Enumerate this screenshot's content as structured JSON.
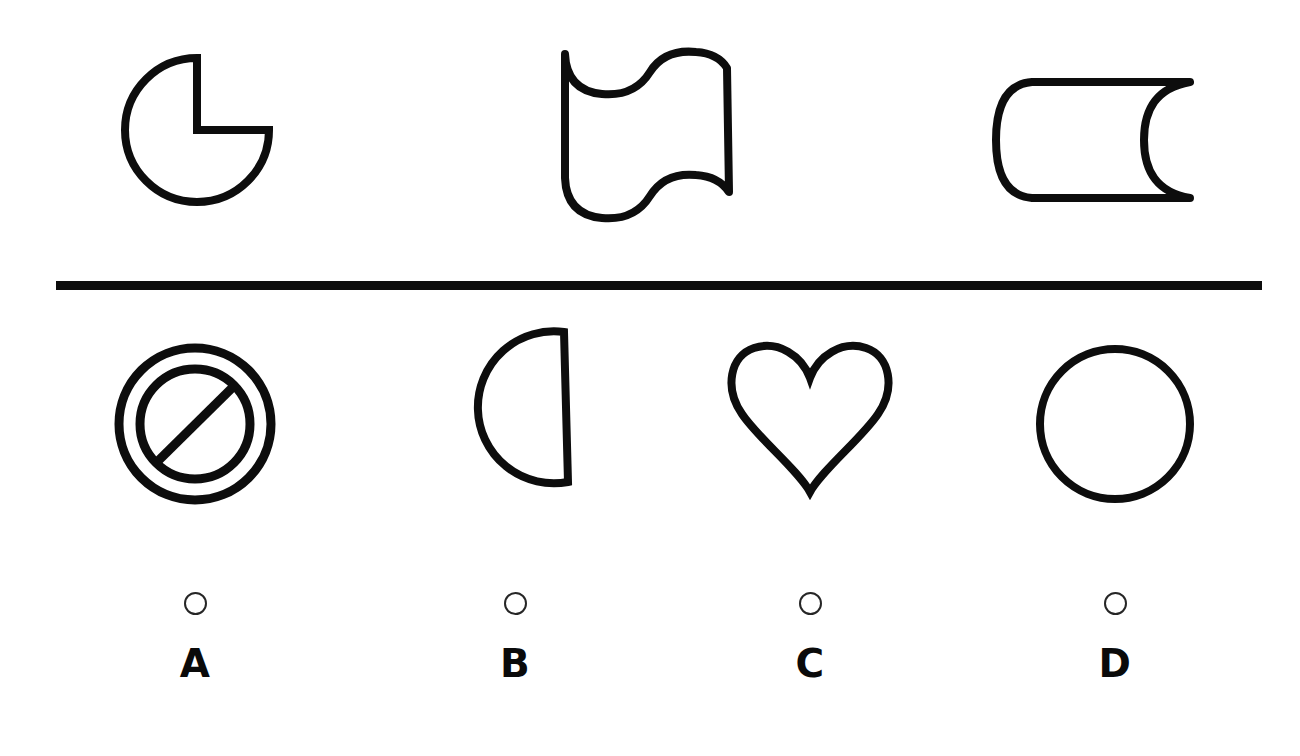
{
  "question": {
    "type": "visual-analogy-multiple-choice",
    "stroke_color": "#0d0d0d",
    "background_color": "#ffffff",
    "divider": {
      "name": "horizontal-rule",
      "color": "#0d0d0d"
    },
    "prompt_shapes": [
      {
        "id": "prompt-1",
        "icon": "pac-man-circle-icon",
        "description": "Circle with a quarter wedge removed from the upper-right quadrant"
      },
      {
        "id": "prompt-2",
        "icon": "wavy-flag-icon",
        "description": "Rectangular flag outline with wavy top and bottom edges"
      },
      {
        "id": "prompt-3",
        "icon": "cylinder-banner-icon",
        "description": "Cylinder-like band with rounded left end and concave right end"
      }
    ],
    "options": [
      {
        "id": "option-a",
        "letter": "A",
        "icon": "prohibition-sign-icon",
        "description": "No-entry sign: outer circle, inner circle, and a diagonal slash",
        "selected": false
      },
      {
        "id": "option-b",
        "letter": "B",
        "icon": "pac-man-rotated-icon",
        "description": "Circle with a quarter wedge removed, rotated so the notch faces right",
        "selected": false
      },
      {
        "id": "option-c",
        "letter": "C",
        "icon": "heart-outline-icon",
        "description": "Heart outline",
        "selected": false
      },
      {
        "id": "option-d",
        "letter": "D",
        "icon": "circle-outline-icon",
        "description": "Plain circle outline",
        "selected": false
      }
    ]
  }
}
